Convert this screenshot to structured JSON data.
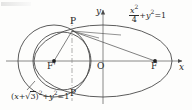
{
  "figure": {
    "kind": "geometry-diagram",
    "background_color": "#fdfdfc",
    "stroke_color": "#4a4a4a",
    "text_color": "#2b2b2b"
  },
  "axes": {
    "x_label": "x",
    "y_label": "y",
    "origin_label": "O",
    "origin_px": {
      "x": 103,
      "y": 61
    },
    "x_axis": {
      "x1": 6,
      "x2": 186,
      "y": 61,
      "arrow": true
    },
    "y_axis": {
      "y1": 8,
      "y2": 104,
      "x": 103,
      "arrow": true
    }
  },
  "points": [
    {
      "name": "P-upper",
      "label": "P",
      "px": {
        "x": 72,
        "y": 31
      },
      "label_px": {
        "x": 70,
        "y": 19
      },
      "dot": false
    },
    {
      "name": "P-lower",
      "label": "P",
      "px": {
        "x": 72,
        "y": 88
      },
      "label_px": {
        "x": 70,
        "y": 90
      },
      "dot": false
    },
    {
      "name": "focus-left",
      "label": "F'",
      "px": {
        "x": 54,
        "y": 61
      },
      "label_px": {
        "x": 49,
        "y": 63
      },
      "dot": true
    },
    {
      "name": "focus-right",
      "label": "F",
      "px": {
        "x": 155,
        "y": 61
      },
      "label_px": {
        "x": 151,
        "y": 63
      },
      "dot": true
    }
  ],
  "curves": {
    "ellipse": {
      "equation_parts": {
        "numerator": "x",
        "numerator_sup": "2",
        "denominator": "4",
        "tail": "+y",
        "tail_sup": "2",
        "equals": "=1"
      },
      "equation_text": "x²/4 + y² = 1",
      "equation_px": {
        "x": 130,
        "y": 8
      },
      "center_px": {
        "x": 103,
        "y": 61
      },
      "rx": 69,
      "ry": 36
    },
    "circle_large": {
      "equation_text": "(x+√3)² + y² = 1",
      "equation_prefix": "(",
      "equation_var": "x",
      "equation_plus": "+",
      "equation_radical": "3",
      "equation_suffix": ")",
      "equation_sup1": "2",
      "equation_mid": "+y",
      "equation_sup2": "2",
      "equation_equals": "=1",
      "equation_px": {
        "x": 12,
        "y": 93
      },
      "center_px": {
        "x": 54,
        "y": 61
      },
      "r": 36,
      "leader": {
        "x1": 26,
        "y1": 91,
        "x2": 34,
        "y2": 82
      }
    },
    "circle_small": {
      "center_px": {
        "x": 60,
        "y": 61
      },
      "r": 30
    }
  },
  "segments": [
    {
      "name": "P-upper-to-focus-right",
      "x1": 72,
      "y1": 31,
      "x2": 155,
      "y2": 61
    },
    {
      "name": "P-upper-to-focus-left",
      "x1": 72,
      "y1": 31,
      "x2": 54,
      "y2": 61
    },
    {
      "name": "P-upper-ray-right",
      "x1": 72,
      "y1": 31,
      "x2": 96,
      "y2": 37
    },
    {
      "name": "P-upper-ray-far",
      "x1": 72,
      "y1": 31,
      "x2": 118,
      "y2": 34
    }
  ],
  "dashed_line": {
    "name": "vertical-chord-PP",
    "x": 72,
    "y1": 18,
    "y2": 101,
    "style": "dash-dot"
  }
}
